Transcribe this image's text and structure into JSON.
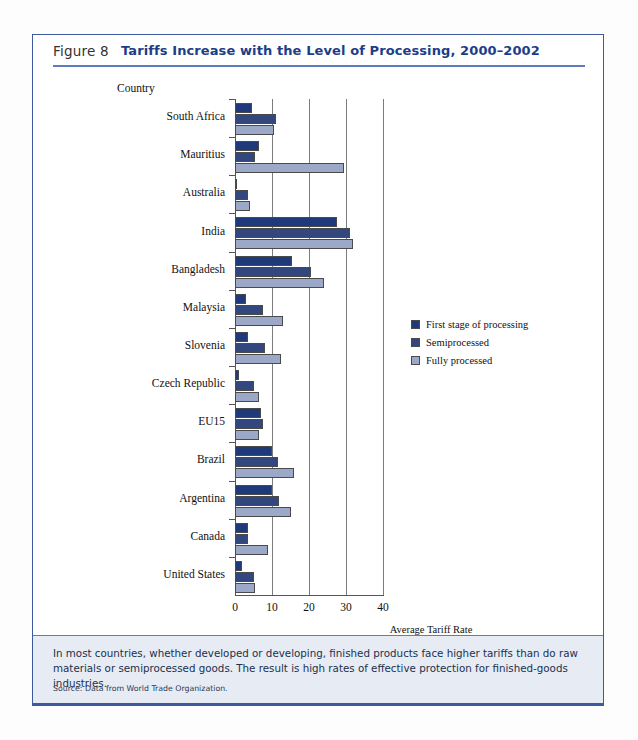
{
  "figure": {
    "number_label": "Figure 8",
    "title": "Tariffs Increase with the Level of Processing, 2000–2002",
    "caption": "In most countries, whether developed or developing, finished products face higher tariffs than do raw materials or semiprocessed goods. The result is high rates of effective protection for finished-goods industries.",
    "source": "Source: Data from World Trade Organization."
  },
  "colors": {
    "frame_blue": "#3d5a9e",
    "title_blue": "#1c3d87",
    "caption_background": "#e7ecf4",
    "series_first_stage": "#1f3a7a",
    "series_semiprocessed": "#32477e",
    "series_fully_processed": "#9ba8c8"
  },
  "chart_data": {
    "type": "bar",
    "orientation": "horizontal",
    "title": "Tariffs Increase with the Level of Processing, 2000–2002",
    "category_axis_label": "Country",
    "xlabel": "Average Tariff Rate\nfor All Sectors",
    "xlabel_line1": "Average Tariff Rate",
    "xlabel_line2": "for All Sectors",
    "ylabel": "Country",
    "xlim": [
      0,
      40
    ],
    "xticks": [
      0,
      10,
      20,
      30,
      40
    ],
    "xtick_labels": [
      "0",
      "10",
      "20",
      "30",
      "40"
    ],
    "grid": "vertical",
    "legend_position": "right-middle",
    "categories": [
      "South Africa",
      "Mauritius",
      "Australia",
      "India",
      "Bangladesh",
      "Malaysia",
      "Slovenia",
      "Czech Republic",
      "EU15",
      "Brazil",
      "Argentina",
      "Canada",
      "United States"
    ],
    "series": [
      {
        "name": "First stage of processing",
        "color": "#1f3a7a",
        "values": [
          4.5,
          6.5,
          0.5,
          27.5,
          15.5,
          3.0,
          3.5,
          1.0,
          7.0,
          10.0,
          10.0,
          3.5,
          2.0
        ]
      },
      {
        "name": "Semiprocessed",
        "color": "#32477e",
        "values": [
          11.0,
          5.5,
          3.5,
          31.0,
          20.5,
          7.5,
          8.0,
          5.0,
          7.5,
          11.5,
          12.0,
          3.5,
          5.0
        ]
      },
      {
        "name": "Fully processed",
        "color": "#9ba8c8",
        "values": [
          10.5,
          29.5,
          4.0,
          32.0,
          24.0,
          13.0,
          12.5,
          6.5,
          6.5,
          16.0,
          15.0,
          9.0,
          5.5
        ]
      }
    ]
  }
}
